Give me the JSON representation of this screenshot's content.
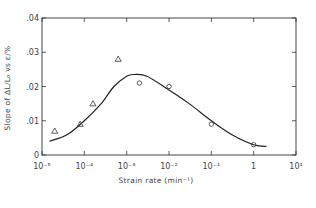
{
  "chart_data": {
    "type": "scatter",
    "title": "",
    "xlabel": "Strain rate (min⁻¹)",
    "ylabel": "Slope of ΔL/L₀ vs ε/%",
    "xscale": "log",
    "xlim": [
      1e-05,
      10
    ],
    "ylim": [
      0,
      0.04
    ],
    "x_tick_labels": [
      "10⁻⁵",
      "10⁻⁴",
      "10⁻³",
      "10⁻²",
      "10⁻¹",
      "1",
      "10¹"
    ],
    "x_tick_values": [
      1e-05,
      0.0001,
      0.001,
      0.01,
      0.1,
      1,
      10
    ],
    "y_tick_labels": [
      "0",
      ".01",
      ".02",
      ".03",
      ".04"
    ],
    "y_tick_values": [
      0,
      0.01,
      0.02,
      0.03,
      0.04
    ],
    "grid": false,
    "legend": null,
    "series": [
      {
        "name": "triangles",
        "marker": "triangle",
        "x": [
          2e-05,
          8e-05,
          0.00016,
          0.00063
        ],
        "y": [
          0.007,
          0.009,
          0.015,
          0.028
        ]
      },
      {
        "name": "circles",
        "marker": "circle",
        "x": [
          0.002,
          0.01,
          0.1,
          1.0
        ],
        "y": [
          0.021,
          0.02,
          0.009,
          0.003
        ]
      },
      {
        "name": "fit curve",
        "marker": "none",
        "x": [
          1.5e-05,
          4e-05,
          0.0001,
          0.00025,
          0.0005,
          0.001,
          0.0015,
          0.003,
          0.01,
          0.03,
          0.1,
          0.3,
          1.0,
          2.0
        ],
        "y": [
          0.004,
          0.006,
          0.01,
          0.015,
          0.02,
          0.023,
          0.0235,
          0.023,
          0.019,
          0.015,
          0.01,
          0.006,
          0.003,
          0.0025
        ]
      }
    ]
  },
  "figure": {
    "caption_fragment": "Fig. ..."
  }
}
